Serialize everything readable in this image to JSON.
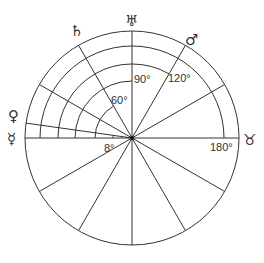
{
  "diagram": {
    "center": [
      132,
      138
    ],
    "outer_radius": 107,
    "line_color": "#333333",
    "angle_labels": [
      {
        "text": "8°",
        "angle": 8
      },
      {
        "text": "60°",
        "angle": 60
      },
      {
        "text": "90°",
        "angle": 90
      },
      {
        "text": "120°",
        "angle": 120
      },
      {
        "text": "180°",
        "angle": 180
      }
    ],
    "planets": [
      {
        "name": "Mercury",
        "symbol": "☿",
        "position": "left, 0°"
      },
      {
        "name": "Venus",
        "symbol": "♀",
        "position": "8°"
      },
      {
        "name": "Saturn",
        "symbol": "♄",
        "position": "60°"
      },
      {
        "name": "Uranus",
        "symbol": "♅",
        "position": "90°"
      },
      {
        "name": "Mars",
        "symbol": "♂",
        "position": "120°"
      },
      {
        "name": "Taurus",
        "symbol": "♉",
        "position": "180°"
      }
    ]
  }
}
